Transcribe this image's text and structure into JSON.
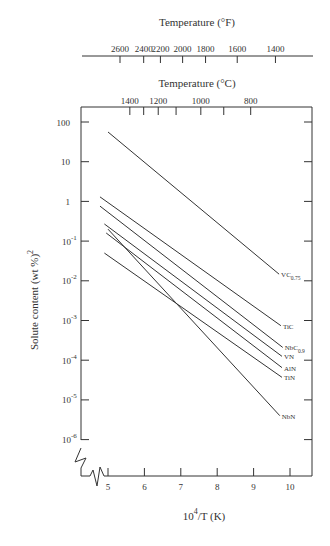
{
  "chart_data": {
    "type": "line",
    "title": "",
    "xlabel": "10^4/T (K)",
    "xlabel_base": "10",
    "xlabel_sup": "4",
    "xlabel_rest": "/T (K)",
    "ylabel": "Solute content (wt %)²",
    "ylabel_main": "Solute content (wt %)",
    "ylabel_sup": "2",
    "yscale": "log",
    "xlim": [
      4.3,
      10.6
    ],
    "ylim": [
      1e-07,
      1000
    ],
    "x_ticks": [
      5,
      6,
      7,
      8,
      9,
      10
    ],
    "y_ticks": [
      {
        "value": 100,
        "label": "100"
      },
      {
        "value": 10,
        "label": "10"
      },
      {
        "value": 1,
        "label": "1"
      },
      {
        "value": 0.1,
        "label": "10",
        "sup": "-1"
      },
      {
        "value": 0.01,
        "label": "10",
        "sup": "-2"
      },
      {
        "value": 0.001,
        "label": "10",
        "sup": "-3"
      },
      {
        "value": 0.0001,
        "label": "10",
        "sup": "-4"
      },
      {
        "value": 1e-05,
        "label": "10",
        "sup": "-5"
      },
      {
        "value": 1e-06,
        "label": "10",
        "sup": "-6"
      }
    ],
    "top_axis_celsius": {
      "label": "Temperature (°C)",
      "ticks": [
        {
          "x": 5.6,
          "label": "1400"
        },
        {
          "x": 5.98,
          "label": ""
        },
        {
          "x": 6.38,
          "label": "1200"
        },
        {
          "x": 6.87,
          "label": ""
        },
        {
          "x": 7.55,
          "label": "1000"
        },
        {
          "x": 8.18,
          "label": ""
        },
        {
          "x": 8.92,
          "label": "800"
        }
      ]
    },
    "top_axis_fahrenheit": {
      "label": "Temperature (°F)",
      "ticks": [
        {
          "x": 5.33,
          "label": "2600"
        },
        {
          "x": 5.98,
          "label": "2400"
        },
        {
          "x": 6.44,
          "label": "2200"
        },
        {
          "x": 7.05,
          "label": "2000"
        },
        {
          "x": 7.68,
          "label": "1800"
        },
        {
          "x": 8.55,
          "label": "1600"
        },
        {
          "x": 9.6,
          "label": "1400"
        }
      ]
    },
    "series": [
      {
        "name": "VC0.75",
        "label": "VC",
        "sub": "0.75",
        "x": [
          5.0,
          9.7
        ],
        "y": [
          56,
          0.0147
        ]
      },
      {
        "name": "TiC",
        "label": "TiC",
        "sub": "",
        "x": [
          4.78,
          9.75
        ],
        "y": [
          1.3,
          0.00074
        ]
      },
      {
        "name": "NbC0.9",
        "label": "NbC",
        "sub": "0.9",
        "x": [
          4.78,
          9.8
        ],
        "y": [
          0.76,
          0.00021
        ]
      },
      {
        "name": "VN",
        "label": "VN",
        "sub": "",
        "x": [
          4.9,
          9.78
        ],
        "y": [
          0.27,
          0.000125
        ]
      },
      {
        "name": "AlN",
        "label": "AlN",
        "sub": "",
        "x": [
          4.95,
          9.78
        ],
        "y": [
          0.16,
          6.5e-05
        ]
      },
      {
        "name": "TiN",
        "label": "TiN",
        "sub": "",
        "x": [
          4.9,
          9.78
        ],
        "y": [
          0.05,
          3.7e-05
        ]
      },
      {
        "name": "NbN",
        "label": "NbN",
        "sub": "",
        "x": [
          5.0,
          9.72
        ],
        "y": [
          0.2,
          4e-06
        ]
      }
    ],
    "grid": false,
    "legend": "inline labels at line ends",
    "axis_break": true
  }
}
